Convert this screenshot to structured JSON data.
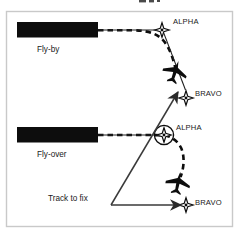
{
  "figure": {
    "title_fragment_visible": "",
    "background_color": "#ffffff",
    "frame_color": "#c9c9c9",
    "ink_color": "#0d0d0d"
  },
  "labels": {
    "fly_by": "Fly-by",
    "fly_over": "Fly-over",
    "track_to_fix": "Track to fix",
    "alpha_top": "ALPHA",
    "alpha_middle": "ALPHA",
    "bravo_upper": "BRAVO",
    "bravo_lower": "BRAVO"
  },
  "symbols": {
    "fix_alpha": "four-point-star-fix-icon",
    "fix_bravo": "four-point-star-fix-icon",
    "aircraft": "aircraft-plan-icon",
    "flyover_ring": "flyover-fix-circle-icon",
    "redaction_bar": "redaction-bar",
    "dashed_path": "dashed-flight-track",
    "solid_path": "solid-course-leg",
    "arrow_head": "arrowhead-icon"
  },
  "diagram_data": {
    "type": "diagram",
    "subject": "RNAV leg termination types",
    "rows": [
      {
        "mode": "Fly-by",
        "label_position": "below-left",
        "fix_from": "ALPHA",
        "fix_to": "BRAVO",
        "turn_behavior": "anticipates turn before crossing ALPHA",
        "fix_circled": false
      },
      {
        "mode": "Fly-over",
        "label_position": "below-left",
        "fix_from": "ALPHA",
        "fix_to": "BRAVO",
        "turn_behavior": "crosses ALPHA before turning",
        "fix_circled": true
      },
      {
        "mode": "Track to fix",
        "label_position": "left-inline",
        "fix_to": "BRAVO",
        "turn_behavior": "direct great-circle track to the fix",
        "fix_circled": false
      }
    ]
  }
}
